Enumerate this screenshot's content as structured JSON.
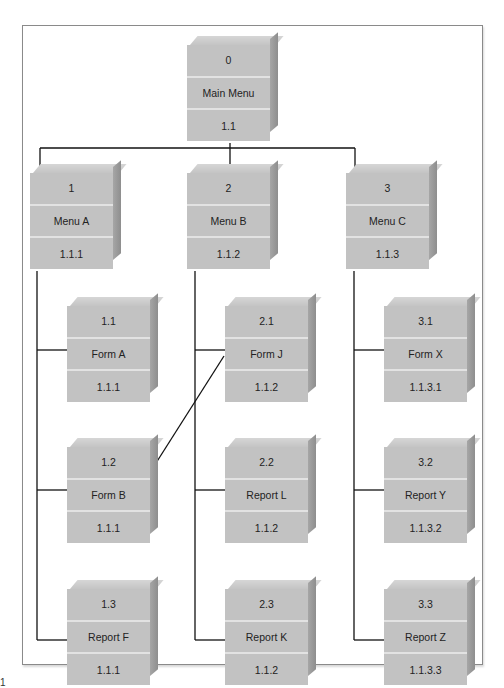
{
  "figure_label": "1",
  "root": {
    "id": "0",
    "name": "Main Menu",
    "ref": "1.1"
  },
  "columns": [
    {
      "menu": {
        "id": "1",
        "name": "Menu A",
        "ref": "1.1.1"
      },
      "children": [
        {
          "id": "1.1",
          "name": "Form A",
          "ref": "1.1.1"
        },
        {
          "id": "1.2",
          "name": "Form B",
          "ref": "1.1.1"
        },
        {
          "id": "1.3",
          "name": "Report F",
          "ref": "1.1.1"
        }
      ]
    },
    {
      "menu": {
        "id": "2",
        "name": "Menu B",
        "ref": "1.1.2"
      },
      "children": [
        {
          "id": "2.1",
          "name": "Form J",
          "ref": "1.1.2"
        },
        {
          "id": "2.2",
          "name": "Report L",
          "ref": "1.1.2"
        },
        {
          "id": "2.3",
          "name": "Report K",
          "ref": "1.1.2"
        }
      ]
    },
    {
      "menu": {
        "id": "3",
        "name": "Menu C",
        "ref": "1.1.3"
      },
      "children": [
        {
          "id": "3.1",
          "name": "Form X",
          "ref": "1.1.3.1"
        },
        {
          "id": "3.2",
          "name": "Report Y",
          "ref": "1.1.3.2"
        },
        {
          "id": "3.3",
          "name": "Report Z",
          "ref": "1.1.3.3"
        }
      ]
    }
  ],
  "cross_links": [
    {
      "from": "1.2",
      "to": "2.1"
    }
  ],
  "colors": {
    "box_face": "#c2c2c2",
    "box_side": "#9a9a9a",
    "line": "#111111",
    "frame": "#8a8a8a"
  }
}
